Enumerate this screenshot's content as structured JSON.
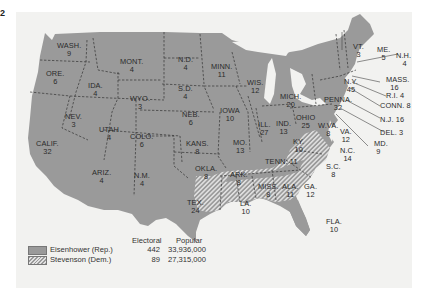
{
  "page_marker": "2",
  "map": {
    "subject": "1952 U.S. presidential election results by state",
    "colors": {
      "republican": "#9a9a9a",
      "democratic_hatch": "#e2e2e2",
      "background": "#f2f2f0",
      "water": "#f2f2f0"
    },
    "states": [
      {
        "abbr": "WASH.",
        "ev": "9",
        "winner": "rep"
      },
      {
        "abbr": "ORE.",
        "ev": "6",
        "winner": "rep"
      },
      {
        "abbr": "CALIF.",
        "ev": "32",
        "winner": "rep"
      },
      {
        "abbr": "NEV.",
        "ev": "3",
        "winner": "rep"
      },
      {
        "abbr": "IDA.",
        "ev": "4",
        "winner": "rep"
      },
      {
        "abbr": "MONT.",
        "ev": "4",
        "winner": "rep"
      },
      {
        "abbr": "WYO.",
        "ev": "3",
        "winner": "rep"
      },
      {
        "abbr": "UTAH",
        "ev": "4",
        "winner": "rep"
      },
      {
        "abbr": "COLO.",
        "ev": "6",
        "winner": "rep"
      },
      {
        "abbr": "ARIZ.",
        "ev": "4",
        "winner": "rep"
      },
      {
        "abbr": "N.M.",
        "ev": "4",
        "winner": "rep"
      },
      {
        "abbr": "N.D.",
        "ev": "4",
        "winner": "rep"
      },
      {
        "abbr": "S.D.",
        "ev": "4",
        "winner": "rep"
      },
      {
        "abbr": "NEB.",
        "ev": "6",
        "winner": "rep"
      },
      {
        "abbr": "KANS.",
        "ev": "8",
        "winner": "rep"
      },
      {
        "abbr": "OKLA.",
        "ev": "8",
        "winner": "rep"
      },
      {
        "abbr": "TEX.",
        "ev": "24",
        "winner": "rep"
      },
      {
        "abbr": "MINN.",
        "ev": "11",
        "winner": "rep"
      },
      {
        "abbr": "IOWA",
        "ev": "10",
        "winner": "rep"
      },
      {
        "abbr": "MO.",
        "ev": "13",
        "winner": "rep"
      },
      {
        "abbr": "ARK.",
        "ev": "8",
        "winner": "dem"
      },
      {
        "abbr": "LA.",
        "ev": "10",
        "winner": "dem"
      },
      {
        "abbr": "WIS.",
        "ev": "12",
        "winner": "rep"
      },
      {
        "abbr": "ILL.",
        "ev": "27",
        "winner": "rep"
      },
      {
        "abbr": "MICH.",
        "ev": "20",
        "winner": "rep"
      },
      {
        "abbr": "IND.",
        "ev": "13",
        "winner": "rep"
      },
      {
        "abbr": "OHIO",
        "ev": "25",
        "winner": "rep"
      },
      {
        "abbr": "KY.",
        "ev": "10",
        "winner": "dem"
      },
      {
        "abbr": "TENN.",
        "ev": "11",
        "winner": "rep"
      },
      {
        "abbr": "MISS.",
        "ev": "8",
        "winner": "dem"
      },
      {
        "abbr": "ALA.",
        "ev": "11",
        "winner": "dem"
      },
      {
        "abbr": "GA.",
        "ev": "12",
        "winner": "dem"
      },
      {
        "abbr": "FLA.",
        "ev": "10",
        "winner": "rep"
      },
      {
        "abbr": "S.C.",
        "ev": "8",
        "winner": "dem"
      },
      {
        "abbr": "N.C.",
        "ev": "14",
        "winner": "dem"
      },
      {
        "abbr": "VA.",
        "ev": "12",
        "winner": "rep"
      },
      {
        "abbr": "W.VA.",
        "ev": "8",
        "winner": "dem"
      },
      {
        "abbr": "MD.",
        "ev": "9",
        "winner": "rep"
      },
      {
        "abbr": "DEL.",
        "ev": "3",
        "winner": "rep"
      },
      {
        "abbr": "N.J.",
        "ev": "16",
        "winner": "rep"
      },
      {
        "abbr": "PENNA.",
        "ev": "32",
        "winner": "rep"
      },
      {
        "abbr": "N.Y.",
        "ev": "45",
        "winner": "rep"
      },
      {
        "abbr": "CONN.",
        "ev": "8",
        "winner": "rep"
      },
      {
        "abbr": "R.I.",
        "ev": "4",
        "winner": "rep"
      },
      {
        "abbr": "MASS.",
        "ev": "16",
        "winner": "rep"
      },
      {
        "abbr": "VT.",
        "ev": "3",
        "winner": "rep"
      },
      {
        "abbr": "N.H.",
        "ev": "4",
        "winner": "rep"
      },
      {
        "abbr": "ME.",
        "ev": "5",
        "winner": "rep"
      }
    ],
    "callouts": {
      "nh": "N.H.\n4",
      "mass": "MASS.\n16",
      "ri": "R.I. 4",
      "conn": "CONN. 8",
      "nj": "N.J. 16",
      "del": "DEL. 3",
      "md": "MD.\n9"
    }
  },
  "legend": {
    "col_electoral": "Electoral",
    "col_popular": "Popular",
    "rows": [
      {
        "name": "Eisenhower (Rep.)",
        "electoral": "442",
        "popular": "33,936,000",
        "pattern": "solid"
      },
      {
        "name": "Stevenson (Dem.)",
        "electoral": "89",
        "popular": "27,315,000",
        "pattern": "hatched"
      }
    ]
  }
}
